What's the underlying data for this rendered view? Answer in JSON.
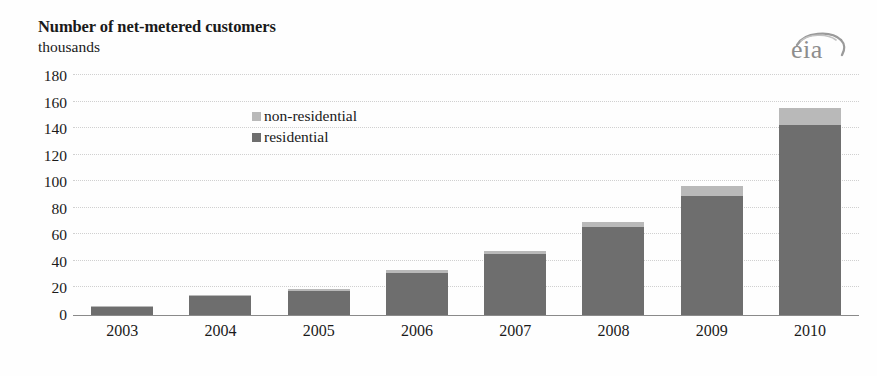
{
  "header": {
    "title": "Number of net-metered customers",
    "subtitle": "thousands"
  },
  "logo": {
    "name": "eia-logo",
    "text": "eia",
    "color": "#8d8d8d"
  },
  "legend": {
    "position": "inside-top-left",
    "items": [
      {
        "label": "non-residential",
        "color": "#b9b9b9",
        "swatch": "square"
      },
      {
        "label": "residential",
        "color": "#6e6e6e",
        "swatch": "square"
      }
    ]
  },
  "axes": {
    "y": {
      "label": "thousands",
      "min": 0,
      "max": 180,
      "step": 20,
      "ticks": [
        "180",
        "160",
        "140",
        "120",
        "100",
        "80",
        "60",
        "40",
        "20",
        "0"
      ]
    },
    "x": {
      "ticks": [
        "2003",
        "2004",
        "2005",
        "2006",
        "2007",
        "2008",
        "2009",
        "2010"
      ]
    }
  },
  "chart_data": {
    "type": "bar",
    "stacked": true,
    "title": "Number of net-metered customers",
    "subtitle": "thousands",
    "xlabel": "",
    "ylabel": "thousands",
    "ylim": [
      0,
      180
    ],
    "ystep": 20,
    "grid": true,
    "legend_position": "inside-top-left",
    "categories": [
      "2003",
      "2004",
      "2005",
      "2006",
      "2007",
      "2008",
      "2009",
      "2010"
    ],
    "series": [
      {
        "name": "residential",
        "color": "#6e6e6e",
        "values": [
          6,
          14,
          18,
          32,
          46,
          66,
          90,
          143
        ]
      },
      {
        "name": "non-residential",
        "color": "#b9b9b9",
        "values": [
          1,
          1,
          1.5,
          2,
          2.5,
          4,
          7,
          13
        ]
      }
    ],
    "totals": [
      7,
      15,
      19.5,
      34,
      48.5,
      70,
      97,
      156
    ]
  },
  "colors": {
    "residential": "#6e6e6e",
    "non_residential": "#b9b9b9",
    "gridline": "#c9c9c9",
    "axis": "#8a8a8a",
    "text": "#1a1a1a",
    "background": "#fefefe"
  }
}
